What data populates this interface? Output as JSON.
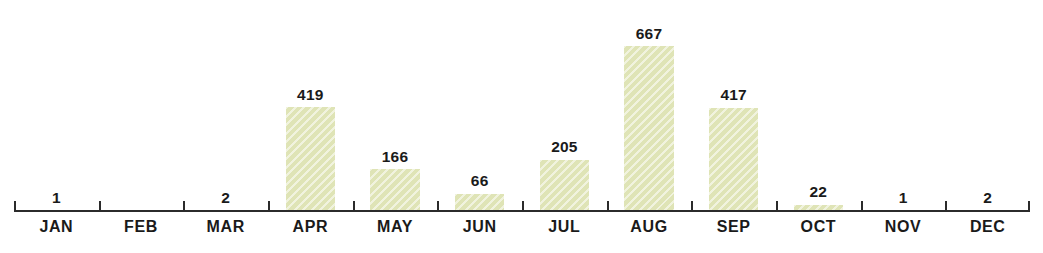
{
  "chart_data": {
    "type": "bar",
    "title": "",
    "subtitle": "",
    "xlabel": "",
    "ylabel": "",
    "categories": [
      "JAN",
      "FEB",
      "MAR",
      "APR",
      "MAY",
      "JUN",
      "JUL",
      "AUG",
      "SEP",
      "OCT",
      "NOV",
      "DEC"
    ],
    "values": [
      1,
      0,
      2,
      419,
      166,
      66,
      205,
      667,
      417,
      22,
      1,
      2
    ],
    "value_labels": [
      "1",
      "",
      "2",
      "419",
      "166",
      "66",
      "205",
      "667",
      "417",
      "22",
      "1",
      "2"
    ],
    "ylim": [
      0,
      750
    ],
    "grid": false,
    "legend": false,
    "bar_color": "#dfe4b6",
    "axis_color": "#2b2b2b",
    "label_color": "#1a1a1a",
    "background": "#ffffff"
  }
}
